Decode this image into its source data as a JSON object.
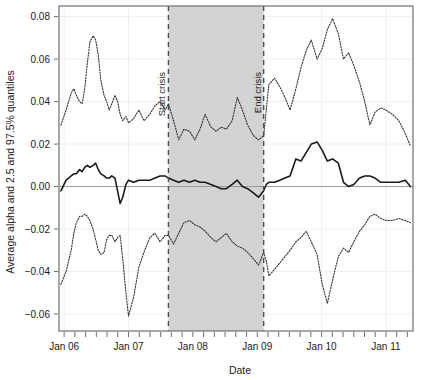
{
  "chart_data": {
    "type": "line",
    "title": "",
    "subtitle": "",
    "xlabel": "Date",
    "ylabel": "Average alpha and 2.5 and 97.5% quantiles",
    "xlim": [
      2005.92,
      2011.42
    ],
    "ylim": [
      -0.068,
      0.085
    ],
    "grid": true,
    "grid_style": "faint light-gray major gridlines",
    "legend": null,
    "legend_position": "none",
    "x_tick_labels": [
      "Jan 06",
      "Jan 07",
      "Jan 08",
      "Jan 09",
      "Jan 10",
      "Jan 11"
    ],
    "x_tick_values": [
      2006.0,
      2007.0,
      2008.0,
      2009.0,
      2010.0,
      2011.0
    ],
    "x_minor_tick_interval_months": 2,
    "y_tick_labels": [
      "0.08",
      "0.06",
      "0.04",
      "0.02",
      "0.00",
      "-0.02",
      "-0.04",
      "-0.06"
    ],
    "y_tick_values": [
      0.08,
      0.06,
      0.04,
      0.02,
      0.0,
      -0.02,
      -0.04,
      -0.06
    ],
    "zero_reference_line": 0.0,
    "shaded_region": {
      "label": "crisis period",
      "x_start": 2007.62,
      "x_end": 2009.1,
      "color": "#d3d3d3"
    },
    "annotations": [
      {
        "text": "Start crisis",
        "x": 2007.62,
        "orientation": "vertical",
        "line_style": "dashed",
        "color": "#4d4d4d"
      },
      {
        "text": "End crisis",
        "x": 2009.1,
        "orientation": "vertical",
        "line_style": "dashed",
        "color": "#4d4d4d"
      }
    ],
    "series": [
      {
        "name": "97.5% quantile",
        "style": "dotted",
        "color": "#333333",
        "x": [
          2005.95,
          2006.03,
          2006.11,
          2006.15,
          2006.19,
          2006.24,
          2006.28,
          2006.32,
          2006.36,
          2006.4,
          2006.45,
          2006.49,
          2006.53,
          2006.57,
          2006.62,
          2006.66,
          2006.7,
          2006.74,
          2006.79,
          2006.83,
          2006.87,
          2006.91,
          2006.96,
          2007.0,
          2007.08,
          2007.16,
          2007.24,
          2007.33,
          2007.41,
          2007.49,
          2007.57,
          2007.62,
          2007.7,
          2007.78,
          2007.86,
          2007.95,
          2008.03,
          2008.11,
          2008.19,
          2008.28,
          2008.36,
          2008.44,
          2008.52,
          2008.61,
          2008.69,
          2008.77,
          2008.85,
          2008.94,
          2009.02,
          2009.1,
          2009.14,
          2009.18,
          2009.27,
          2009.35,
          2009.43,
          2009.51,
          2009.6,
          2009.68,
          2009.76,
          2009.84,
          2009.93,
          2010.01,
          2010.09,
          2010.17,
          2010.26,
          2010.34,
          2010.42,
          2010.5,
          2010.59,
          2010.67,
          2010.75,
          2010.83,
          2010.92,
          2011.0,
          2011.1,
          2011.2,
          2011.3,
          2011.38
        ],
        "values": [
          0.029,
          0.036,
          0.044,
          0.046,
          0.043,
          0.04,
          0.039,
          0.046,
          0.058,
          0.068,
          0.071,
          0.069,
          0.062,
          0.05,
          0.043,
          0.04,
          0.036,
          0.039,
          0.043,
          0.04,
          0.034,
          0.031,
          0.033,
          0.03,
          0.032,
          0.036,
          0.031,
          0.034,
          0.038,
          0.04,
          0.036,
          0.039,
          0.031,
          0.022,
          0.027,
          0.026,
          0.022,
          0.027,
          0.034,
          0.028,
          0.026,
          0.028,
          0.027,
          0.031,
          0.042,
          0.036,
          0.029,
          0.024,
          0.022,
          0.024,
          0.036,
          0.048,
          0.051,
          0.047,
          0.042,
          0.036,
          0.046,
          0.056,
          0.064,
          0.069,
          0.06,
          0.065,
          0.074,
          0.079,
          0.072,
          0.06,
          0.063,
          0.057,
          0.049,
          0.04,
          0.029,
          0.035,
          0.037,
          0.036,
          0.034,
          0.031,
          0.025,
          0.019
        ]
      },
      {
        "name": "Average alpha",
        "style": "solid",
        "color": "#1a1a1a",
        "x": [
          2005.95,
          2006.03,
          2006.11,
          2006.15,
          2006.19,
          2006.24,
          2006.28,
          2006.32,
          2006.36,
          2006.4,
          2006.45,
          2006.49,
          2006.53,
          2006.57,
          2006.62,
          2006.66,
          2006.7,
          2006.74,
          2006.79,
          2006.83,
          2006.87,
          2006.91,
          2006.96,
          2007.0,
          2007.08,
          2007.16,
          2007.24,
          2007.33,
          2007.41,
          2007.49,
          2007.57,
          2007.62,
          2007.7,
          2007.78,
          2007.86,
          2007.95,
          2008.03,
          2008.11,
          2008.19,
          2008.28,
          2008.36,
          2008.44,
          2008.52,
          2008.61,
          2008.69,
          2008.77,
          2008.85,
          2008.94,
          2009.02,
          2009.1,
          2009.14,
          2009.18,
          2009.27,
          2009.35,
          2009.43,
          2009.51,
          2009.6,
          2009.68,
          2009.76,
          2009.84,
          2009.93,
          2010.01,
          2010.09,
          2010.17,
          2010.26,
          2010.34,
          2010.42,
          2010.5,
          2010.59,
          2010.67,
          2010.75,
          2010.83,
          2010.92,
          2011.0,
          2011.1,
          2011.2,
          2011.3,
          2011.38
        ],
        "values": [
          -0.002,
          0.003,
          0.005,
          0.006,
          0.006,
          0.008,
          0.007,
          0.009,
          0.01,
          0.009,
          0.01,
          0.011,
          0.008,
          0.006,
          0.005,
          0.004,
          0.004,
          0.005,
          0.004,
          -0.002,
          -0.008,
          -0.005,
          0.001,
          0.003,
          0.002,
          0.003,
          0.003,
          0.003,
          0.004,
          0.005,
          0.005,
          0.004,
          0.003,
          0.002,
          0.003,
          0.002,
          0.003,
          0.002,
          0.002,
          0.001,
          0.0,
          -0.001,
          -0.001,
          0.001,
          0.003,
          0.0,
          -0.001,
          -0.003,
          -0.005,
          -0.002,
          0.001,
          0.002,
          0.002,
          0.003,
          0.004,
          0.005,
          0.013,
          0.012,
          0.016,
          0.02,
          0.021,
          0.017,
          0.012,
          0.013,
          0.011,
          0.002,
          0.0,
          0.001,
          0.004,
          0.005,
          0.005,
          0.004,
          0.002,
          0.002,
          0.002,
          0.002,
          0.003,
          0.0
        ]
      },
      {
        "name": "2.5% quantile",
        "style": "dotted",
        "color": "#333333",
        "x": [
          2005.95,
          2006.03,
          2006.11,
          2006.15,
          2006.19,
          2006.24,
          2006.28,
          2006.32,
          2006.36,
          2006.4,
          2006.45,
          2006.49,
          2006.53,
          2006.57,
          2006.62,
          2006.66,
          2006.7,
          2006.74,
          2006.79,
          2006.83,
          2006.87,
          2006.91,
          2006.96,
          2007.0,
          2007.08,
          2007.16,
          2007.24,
          2007.33,
          2007.41,
          2007.49,
          2007.57,
          2007.62,
          2007.7,
          2007.78,
          2007.86,
          2007.95,
          2008.03,
          2008.11,
          2008.19,
          2008.28,
          2008.36,
          2008.44,
          2008.52,
          2008.61,
          2008.69,
          2008.77,
          2008.85,
          2008.94,
          2009.02,
          2009.1,
          2009.14,
          2009.18,
          2009.27,
          2009.35,
          2009.43,
          2009.51,
          2009.6,
          2009.68,
          2009.76,
          2009.84,
          2009.93,
          2010.01,
          2010.09,
          2010.17,
          2010.26,
          2010.34,
          2010.42,
          2010.5,
          2010.59,
          2010.67,
          2010.75,
          2010.83,
          2010.92,
          2011.0,
          2011.1,
          2011.2,
          2011.3,
          2011.38
        ],
        "values": [
          -0.046,
          -0.04,
          -0.03,
          -0.022,
          -0.017,
          -0.014,
          -0.014,
          -0.013,
          -0.014,
          -0.016,
          -0.02,
          -0.025,
          -0.03,
          -0.032,
          -0.031,
          -0.025,
          -0.023,
          -0.023,
          -0.026,
          -0.024,
          -0.023,
          -0.034,
          -0.05,
          -0.061,
          -0.052,
          -0.038,
          -0.031,
          -0.024,
          -0.022,
          -0.026,
          -0.023,
          -0.023,
          -0.027,
          -0.022,
          -0.017,
          -0.016,
          -0.018,
          -0.019,
          -0.021,
          -0.024,
          -0.026,
          -0.024,
          -0.022,
          -0.026,
          -0.028,
          -0.029,
          -0.031,
          -0.034,
          -0.037,
          -0.031,
          -0.035,
          -0.042,
          -0.039,
          -0.036,
          -0.033,
          -0.03,
          -0.026,
          -0.024,
          -0.021,
          -0.026,
          -0.032,
          -0.046,
          -0.055,
          -0.044,
          -0.033,
          -0.029,
          -0.031,
          -0.026,
          -0.021,
          -0.018,
          -0.014,
          -0.013,
          -0.015,
          -0.016,
          -0.016,
          -0.015,
          -0.016,
          -0.017
        ]
      }
    ]
  },
  "axes": {
    "x_title": "Date",
    "y_title": "Average alpha and 2.5 and 97.5% quantiles"
  },
  "colors": {
    "background": "#ffffff",
    "frame": "#6e6e6e",
    "shaded_band": "#d3d3d3",
    "crisis_line": "#4d4d4d",
    "mean_line": "#1a1a1a",
    "quantile_line": "#333333",
    "gridline": "#efefef",
    "zero_line": "#9a9a9a",
    "text": "#1a1a1a"
  }
}
